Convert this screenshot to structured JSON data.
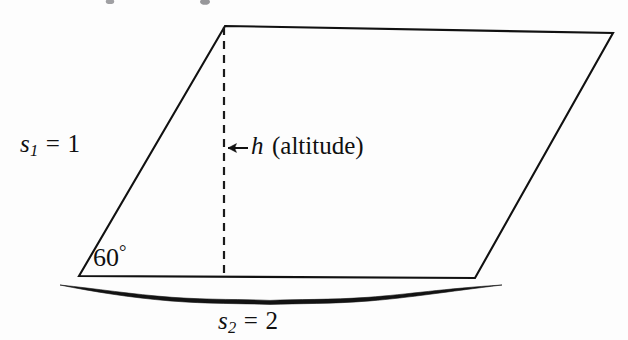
{
  "figure": {
    "background_color": "#fdfdfd",
    "stroke_color": "#111111"
  },
  "shape": {
    "name": "parallelogram",
    "vertices": {
      "bottom_left": [
        79,
        276
      ],
      "top_left": [
        225,
        26
      ],
      "top_right": [
        613,
        33
      ],
      "bottom_right": [
        475,
        278
      ]
    }
  },
  "altitude": {
    "style": "dashed",
    "x": 224,
    "y_top": 27,
    "y_bottom": 277
  },
  "labels": {
    "side1": {
      "var": "s",
      "sub": "1",
      "rel": "=",
      "value": "1",
      "full_text": "s1 = 1"
    },
    "altitude": {
      "arrow": "←",
      "var": "h",
      "note": "(altitude)",
      "full_text": "← h (altitude)"
    },
    "angle": {
      "value": "60",
      "unit": "°",
      "full_text": "60°"
    },
    "side2": {
      "var": "s",
      "sub": "2",
      "rel": "=",
      "value": "2",
      "full_text": "s2 = 2"
    }
  },
  "brace": {
    "orientation": "horizontal",
    "points_to": "base",
    "x_start": 60,
    "x_end": 502,
    "cusp_x": 270,
    "cusp_y": 300
  }
}
